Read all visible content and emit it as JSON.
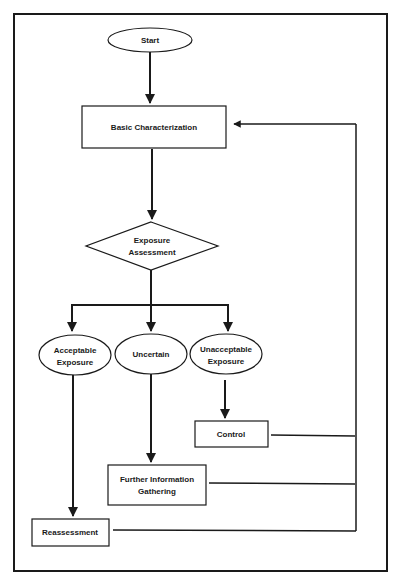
{
  "diagram": {
    "type": "flowchart",
    "colors": {
      "stroke": "#1a1a1a",
      "background": "#ffffff"
    },
    "nodes": {
      "start": {
        "shape": "ellipse",
        "lines": [
          "Start"
        ]
      },
      "basic_characterization": {
        "shape": "rectangle",
        "lines": [
          "Basic Characterization"
        ]
      },
      "exposure_assessment": {
        "shape": "diamond",
        "lines": [
          "Exposure",
          "Assessment"
        ]
      },
      "acceptable_exposure": {
        "shape": "ellipse",
        "lines": [
          "Acceptable",
          "Exposure"
        ]
      },
      "uncertain": {
        "shape": "ellipse",
        "lines": [
          "Uncertain"
        ]
      },
      "unacceptable_exposure": {
        "shape": "ellipse",
        "lines": [
          "Unacceptable",
          "Exposure"
        ]
      },
      "control": {
        "shape": "rectangle",
        "lines": [
          "Control"
        ]
      },
      "further_information_gathering": {
        "shape": "rectangle",
        "lines": [
          "Further Information",
          "Gathering"
        ]
      },
      "reassessment": {
        "shape": "rectangle",
        "lines": [
          "Reassessment"
        ]
      }
    },
    "edges": [
      {
        "from": "start",
        "to": "basic_characterization"
      },
      {
        "from": "basic_characterization",
        "to": "exposure_assessment"
      },
      {
        "from": "exposure_assessment",
        "to": "acceptable_exposure"
      },
      {
        "from": "exposure_assessment",
        "to": "uncertain"
      },
      {
        "from": "exposure_assessment",
        "to": "unacceptable_exposure"
      },
      {
        "from": "acceptable_exposure",
        "to": "reassessment"
      },
      {
        "from": "uncertain",
        "to": "further_information_gathering"
      },
      {
        "from": "unacceptable_exposure",
        "to": "control"
      },
      {
        "from": "control",
        "to": "basic_characterization",
        "type": "feedback"
      },
      {
        "from": "further_information_gathering",
        "to": "basic_characterization",
        "type": "feedback"
      },
      {
        "from": "reassessment",
        "to": "basic_characterization",
        "type": "feedback"
      }
    ]
  }
}
